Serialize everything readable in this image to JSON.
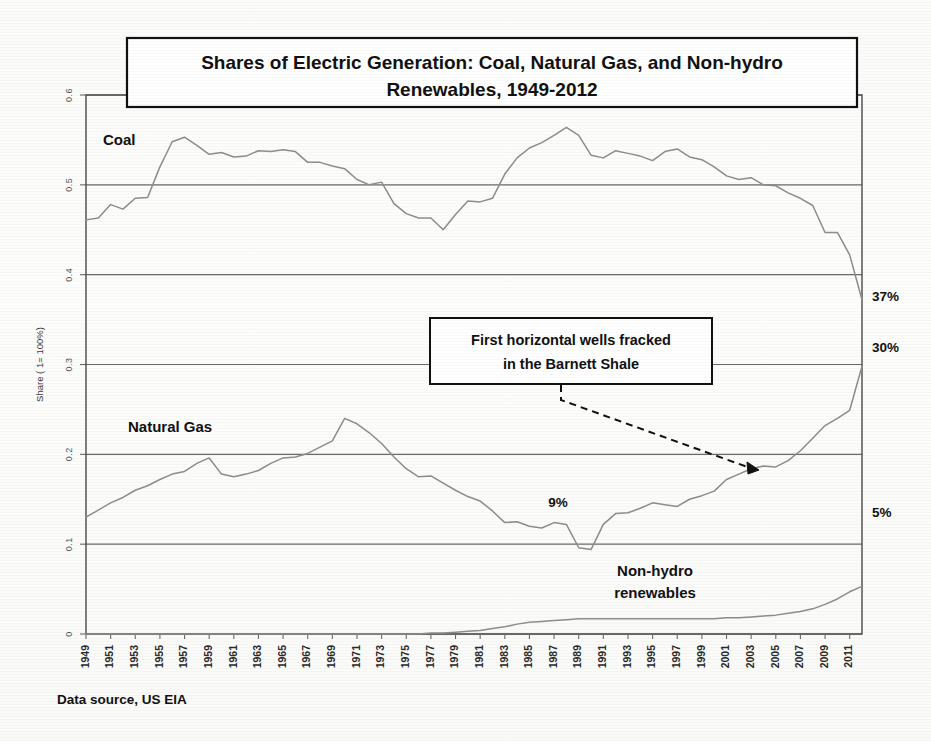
{
  "figure": {
    "title_line1": "Shares of Electric Generation:  Coal, Natural Gas, and Non-hydro",
    "title_line2": "Renewables, 1949-2012",
    "source_note": "Data source, US EIA"
  },
  "annotation": {
    "line1": "First horizontal wells fracked",
    "line2": "in the Barnett Shale"
  },
  "series_labels": {
    "coal": "Coal",
    "natural_gas": "Natural Gas",
    "renewables_line1": "Non-hydro",
    "renewables_line2": "renewables"
  },
  "value_callouts": {
    "coal_end": "37%",
    "gas_end": "30%",
    "renewables_end": "5%",
    "gas_min": "9%"
  },
  "colors": {
    "line": "#8d8d8d",
    "grid": "#6a6a6a",
    "frame": "#4a4a4a",
    "text": "#111111",
    "background": "#ffffff"
  },
  "chart_data": {
    "type": "line",
    "xlabel": "",
    "ylabel": "Share ( 1= 100%)",
    "ylim": [
      0,
      0.6
    ],
    "yticks": [
      0,
      0.1,
      0.2,
      0.3,
      0.4,
      0.5,
      0.6
    ],
    "ytick_labels": [
      "0",
      "0.1",
      "0.2",
      "0.3",
      "0.4",
      "0.5",
      "0.6"
    ],
    "grid": true,
    "legend": "inline-labels",
    "xlim": [
      1949,
      2012
    ],
    "x": [
      1949,
      1950,
      1951,
      1952,
      1953,
      1954,
      1955,
      1956,
      1957,
      1958,
      1959,
      1960,
      1961,
      1962,
      1963,
      1964,
      1965,
      1966,
      1967,
      1968,
      1969,
      1970,
      1971,
      1972,
      1973,
      1974,
      1975,
      1976,
      1977,
      1978,
      1979,
      1980,
      1981,
      1982,
      1983,
      1984,
      1985,
      1986,
      1987,
      1988,
      1989,
      1990,
      1991,
      1992,
      1993,
      1994,
      1995,
      1996,
      1997,
      1998,
      1999,
      2000,
      2001,
      2002,
      2003,
      2004,
      2005,
      2006,
      2007,
      2008,
      2009,
      2010,
      2011,
      2012
    ],
    "xtick_labels": [
      "1949",
      "1951",
      "1953",
      "1955",
      "1957",
      "1959",
      "1961",
      "1963",
      "1965",
      "1967",
      "1969",
      "1971",
      "1973",
      "1975",
      "1977",
      "1979",
      "1981",
      "1983",
      "1985",
      "1987",
      "1989",
      "1991",
      "1993",
      "1995",
      "1997",
      "1999",
      "2001",
      "2003",
      "2005",
      "2007",
      "2009",
      "2011"
    ],
    "series": [
      {
        "name": "Coal",
        "end_label": "37%",
        "values": [
          0.461,
          0.463,
          0.478,
          0.473,
          0.485,
          0.486,
          0.52,
          0.548,
          0.553,
          0.544,
          0.534,
          0.536,
          0.531,
          0.532,
          0.538,
          0.537,
          0.539,
          0.537,
          0.525,
          0.525,
          0.521,
          0.518,
          0.506,
          0.5,
          0.503,
          0.479,
          0.468,
          0.463,
          0.463,
          0.45,
          0.467,
          0.482,
          0.481,
          0.485,
          0.512,
          0.53,
          0.541,
          0.547,
          0.555,
          0.564,
          0.555,
          0.533,
          0.53,
          0.538,
          0.535,
          0.532,
          0.527,
          0.537,
          0.54,
          0.531,
          0.528,
          0.52,
          0.51,
          0.506,
          0.508,
          0.5,
          0.499,
          0.491,
          0.485,
          0.477,
          0.447,
          0.447,
          0.422,
          0.372
        ]
      },
      {
        "name": "Natural Gas",
        "end_label": "30%",
        "values": [
          0.13,
          0.138,
          0.146,
          0.152,
          0.16,
          0.165,
          0.172,
          0.178,
          0.181,
          0.19,
          0.196,
          0.178,
          0.175,
          0.178,
          0.182,
          0.19,
          0.196,
          0.197,
          0.201,
          0.208,
          0.215,
          0.24,
          0.234,
          0.224,
          0.212,
          0.197,
          0.184,
          0.175,
          0.176,
          0.168,
          0.16,
          0.153,
          0.148,
          0.137,
          0.124,
          0.125,
          0.12,
          0.118,
          0.124,
          0.122,
          0.096,
          0.094,
          0.122,
          0.134,
          0.135,
          0.14,
          0.146,
          0.144,
          0.142,
          0.15,
          0.154,
          0.159,
          0.172,
          0.178,
          0.184,
          0.187,
          0.186,
          0.193,
          0.204,
          0.218,
          0.232,
          0.24,
          0.249,
          0.298
        ]
      },
      {
        "name": "Non-hydro renewables",
        "end_label": "5%",
        "values": [
          0.0,
          0.0,
          0.0,
          0.0,
          0.0,
          0.0,
          0.0,
          0.0,
          0.0,
          0.0,
          0.0,
          0.0,
          0.0,
          0.0,
          0.0,
          0.0,
          0.0,
          0.0,
          0.0,
          0.0,
          0.0,
          0.0,
          0.0,
          0.0,
          0.0,
          0.0,
          0.0,
          0.0,
          0.001,
          0.001,
          0.002,
          0.003,
          0.004,
          0.006,
          0.008,
          0.011,
          0.013,
          0.014,
          0.015,
          0.016,
          0.017,
          0.017,
          0.017,
          0.017,
          0.017,
          0.017,
          0.017,
          0.017,
          0.017,
          0.017,
          0.017,
          0.017,
          0.018,
          0.018,
          0.019,
          0.02,
          0.021,
          0.023,
          0.025,
          0.028,
          0.033,
          0.039,
          0.047,
          0.053
        ]
      }
    ],
    "annotations": [
      {
        "text": "First horizontal wells fracked in the Barnett Shale",
        "points_to_year": 2003,
        "points_to_value": 0.19
      },
      {
        "text": "9%",
        "year": 1990,
        "value": 0.094
      },
      {
        "text": "37%",
        "year": 2012,
        "value": 0.372
      },
      {
        "text": "30%",
        "year": 2012,
        "value": 0.298
      },
      {
        "text": "5%",
        "year": 2012,
        "value": 0.053
      }
    ]
  }
}
